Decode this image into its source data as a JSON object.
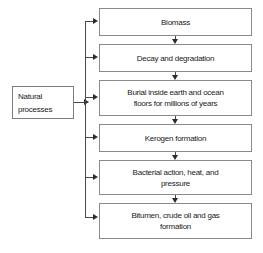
{
  "diagram": {
    "colors": {
      "box_border": "#8a8a8a",
      "connector": "#4a4a4a",
      "arrowhead": "#2b2b2b",
      "text": "#1a1a1a",
      "background": "#ffffff"
    },
    "source": {
      "id": "natural-processes",
      "label": "Natural\nprocesses"
    },
    "stages": [
      {
        "id": "biomass",
        "label": "Biomass"
      },
      {
        "id": "decay-and-degradation",
        "label": "Decay and degradation"
      },
      {
        "id": "burial-inside-earth-and-ocean-floors",
        "label": "Burial inside earth and ocean\nfloors for millions of years"
      },
      {
        "id": "kerogen-formation",
        "label": "Kerogen formation"
      },
      {
        "id": "bacterial-action-heat-and-pressure",
        "label": "Bacterial action, heat, and\npressure"
      },
      {
        "id": "bitumen-crude-oil-and-gas-formation",
        "label": "Bitumen, crude oil and gas\nformation"
      }
    ]
  }
}
